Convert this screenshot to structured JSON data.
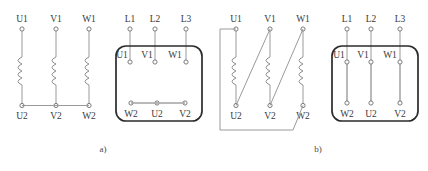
{
  "figure": {
    "background_color": "#ffffff",
    "wire_color": "#9a9a9a",
    "box_outline_color": "#2b2b2b",
    "label_color": "#3a3a3a",
    "link_bar_color": "#a8a8a8"
  },
  "panels": [
    {
      "id": "a",
      "caption": "a)",
      "connection_type": "star",
      "winding": {
        "top_terminals": [
          "U1",
          "V1",
          "W1"
        ],
        "bottom_terminals": [
          "U2",
          "V2",
          "W2"
        ],
        "bridge": "U2-V2-W2"
      },
      "terminal_box": {
        "supply_terminals": [
          "L1",
          "L2",
          "L3"
        ],
        "top_row": [
          "U1",
          "V1",
          "W1"
        ],
        "bottom_row": [
          "W2",
          "U2",
          "V2"
        ],
        "links": [
          "W2-U2-V2"
        ]
      }
    },
    {
      "id": "b",
      "caption": "b)",
      "connection_type": "delta",
      "winding": {
        "top_terminals": [
          "U1",
          "V1",
          "W1"
        ],
        "bottom_terminals": [
          "U2",
          "V2",
          "W2"
        ],
        "bridges": [
          "U1-W2",
          "V1-U2",
          "W1-V2"
        ]
      },
      "terminal_box": {
        "supply_terminals": [
          "L1",
          "L2",
          "L3"
        ],
        "top_row": [
          "U1",
          "V1",
          "W1"
        ],
        "bottom_row": [
          "W2",
          "U2",
          "V2"
        ],
        "links": [
          "U1-W2",
          "V1-U2",
          "W1-V2"
        ]
      }
    }
  ],
  "labels": {
    "a_coil_u1": "U1",
    "a_coil_v1": "V1",
    "a_coil_w1": "W1",
    "a_coil_u2": "U2",
    "a_coil_v2": "V2",
    "a_coil_w2": "W2",
    "a_box_l1": "L1",
    "a_box_l2": "L2",
    "a_box_l3": "L3",
    "a_box_u1": "U1",
    "a_box_v1": "V1",
    "a_box_w1": "W1",
    "a_box_w2": "W2",
    "a_box_u2": "U2",
    "a_box_v2": "V2",
    "a_caption": "a)",
    "b_coil_u1": "U1",
    "b_coil_v1": "V1",
    "b_coil_w1": "W1",
    "b_coil_u2": "U2",
    "b_coil_v2": "V2",
    "b_coil_w2": "W2",
    "b_box_l1": "L1",
    "b_box_l2": "L2",
    "b_box_l3": "L3",
    "b_box_u1": "U1",
    "b_box_v1": "V1",
    "b_box_w1": "W1",
    "b_box_w2": "W2",
    "b_box_u2": "U2",
    "b_box_v2": "V2",
    "b_caption": "b)"
  }
}
